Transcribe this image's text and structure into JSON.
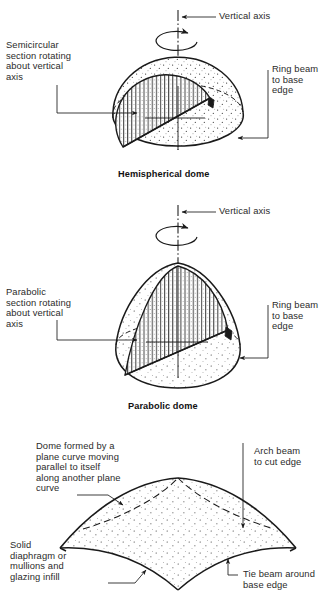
{
  "figure": {
    "background": "#ffffff",
    "ink": "#1a1a1a"
  },
  "panels": [
    {
      "id": "hemispherical",
      "caption": "Hemispherical dome",
      "labels": {
        "axis": "Vertical axis",
        "left": "Semicircular\nsection rotating\nabout vertical\naxis",
        "right": "Ring beam\nto base\nedge"
      }
    },
    {
      "id": "parabolic",
      "caption": "Parabolic dome",
      "labels": {
        "axis": "Vertical axis",
        "left": "Parabolic\nsection rotating\nabout vertical\naxis",
        "right": "Ring beam\nto base\nedge"
      }
    },
    {
      "id": "translational",
      "caption": "",
      "labels": {
        "topleft": "Dome formed by a\nplane curve moving\nparallel to itself\nalong another plane\ncurve",
        "topright": "Arch beam\nto cut edge",
        "bottomleft": "Solid\ndiaphragm or\nmullions and\nglazing infill",
        "bottomright": "Tie beam around\nbase edge"
      }
    }
  ]
}
